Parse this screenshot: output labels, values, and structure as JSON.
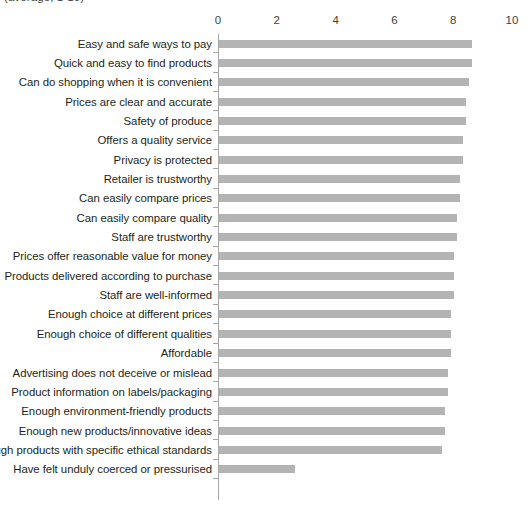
{
  "chart_data": {
    "type": "bar",
    "orientation": "horizontal",
    "title": "(average, 1-10)",
    "xlabel": "",
    "ylabel": "",
    "xlim": [
      0,
      10
    ],
    "xticks": [
      0,
      2,
      4,
      6,
      8,
      10
    ],
    "xtick_labels": [
      "0",
      "2",
      "4",
      "6",
      "8",
      "10"
    ],
    "grid": false,
    "legend": false,
    "bar_color": "#b4b4b4",
    "axis_color": "#a6a6a6",
    "text_color": "#231f20",
    "categories": [
      "Easy and safe ways to pay",
      "Quick and easy to find products",
      "Can do shopping when it is convenient",
      "Prices are clear and accurate",
      "Safety of produce",
      "Offers a quality service",
      "Privacy is protected",
      "Retailer is trustworthy",
      "Can easily compare prices",
      "Can easily compare quality",
      "Staff are trustworthy",
      "Prices offer reasonable value for money",
      "Products delivered according to purchase",
      "Staff are well-informed",
      "Enough choice at different prices",
      "Enough choice of different qualities",
      "Affordable",
      "Advertising does not deceive or mislead",
      "Product information on labels/packaging",
      "Enough environment-friendly products",
      "Enough new products/innovative ideas",
      "Enough products with specific ethical standards",
      "Have felt unduly coerced or pressurised"
    ],
    "values": [
      8.6,
      8.6,
      8.5,
      8.4,
      8.4,
      8.3,
      8.3,
      8.2,
      8.2,
      8.1,
      8.1,
      8.0,
      8.0,
      8.0,
      7.9,
      7.9,
      7.9,
      7.8,
      7.8,
      7.7,
      7.7,
      7.6,
      2.6
    ]
  }
}
